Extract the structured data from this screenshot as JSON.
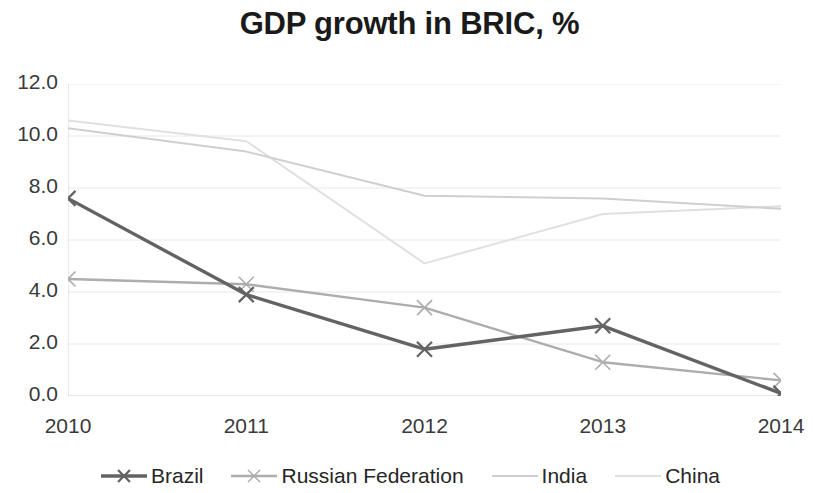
{
  "chart_data": {
    "type": "line",
    "title": "GDP growth in BRIC, %",
    "xlabel": "",
    "ylabel": "",
    "x": [
      "2010",
      "2011",
      "2012",
      "2013",
      "2014"
    ],
    "categories": [
      "2010",
      "2011",
      "2012",
      "2013",
      "2014"
    ],
    "ylim": [
      0.0,
      12.0
    ],
    "yticks": [
      "0.0",
      "2.0",
      "4.0",
      "6.0",
      "8.0",
      "10.0",
      "12.0"
    ],
    "ytick_values": [
      0.0,
      2.0,
      4.0,
      6.0,
      8.0,
      10.0,
      12.0
    ],
    "grid": true,
    "legend_position": "bottom",
    "series": [
      {
        "name": "Brazil",
        "values": [
          7.6,
          3.9,
          1.8,
          2.7,
          0.1
        ],
        "color": "#636363",
        "marker": "x",
        "width": 3.4
      },
      {
        "name": "Russian Federation",
        "values": [
          4.5,
          4.3,
          3.4,
          1.3,
          0.6
        ],
        "color": "#adadad",
        "marker": "x",
        "width": 2.4
      },
      {
        "name": "India",
        "values": [
          10.3,
          9.4,
          7.7,
          7.6,
          7.2
        ],
        "color": "#cfcfcf",
        "marker": "none",
        "width": 2.0
      },
      {
        "name": "China",
        "values": [
          10.6,
          9.8,
          5.1,
          7.0,
          7.3
        ],
        "color": "#e0e0e0",
        "marker": "none",
        "width": 2.0
      }
    ],
    "gridline_color": "#e8e8e8",
    "axis_color": "#d9d9d9",
    "text_color": "#262626"
  }
}
